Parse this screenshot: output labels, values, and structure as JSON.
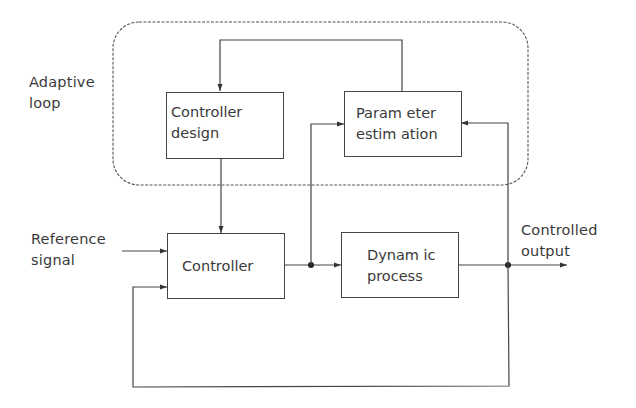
{
  "diagram": {
    "title_label": {
      "line1": "Adaptive",
      "line2": "loop"
    },
    "blocks": {
      "controller_design": {
        "line1": "Controller",
        "line2": "design"
      },
      "parameter_estimation": {
        "line1": "Param eter",
        "line2": "estim ation"
      },
      "controller": {
        "line1": "Controller"
      },
      "dynamic_process": {
        "line1": "Dynam ic",
        "line2": "process"
      }
    },
    "signals": {
      "reference": {
        "line1": "Reference",
        "line2": "signal"
      },
      "output": {
        "line1": "Controlled",
        "line2": "output"
      }
    },
    "colors": {
      "line": "#444444",
      "text": "#3a3a3a",
      "background": "#ffffff"
    }
  }
}
